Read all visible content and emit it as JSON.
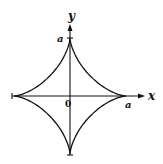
{
  "figure": {
    "type": "astroid",
    "equation_hint": "x^(2/3) + y^(2/3) = a^(2/3)",
    "colors": {
      "stroke": "#111111",
      "background": "#ffffff"
    },
    "labels": {
      "y_axis": "y",
      "x_axis": "x",
      "origin": "0",
      "top_intercept": "a",
      "right_intercept": "a"
    },
    "geometry": {
      "center": [
        70,
        96
      ],
      "radius_x": 56,
      "radius_y": 58
    }
  }
}
